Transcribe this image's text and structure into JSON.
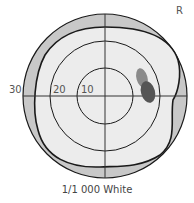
{
  "eye_label": "R",
  "caption": "1/1 000 White",
  "ring_labels": [
    "30",
    "20",
    "10"
  ],
  "colors": {
    "outer_band": "#c8c8c8",
    "field": "#ececec",
    "scotoma_relative": "#8a8a8a",
    "scotoma_absolute": "#555555",
    "lines": "#1a1a1a"
  }
}
